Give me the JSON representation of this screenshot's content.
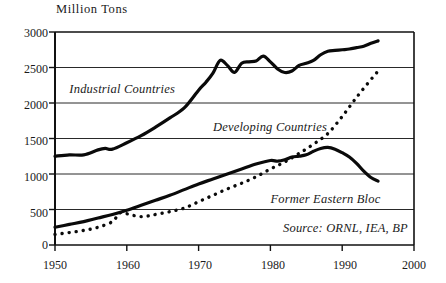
{
  "chart_data": {
    "type": "line",
    "title": "Million Tons",
    "xlabel": "",
    "ylabel": "Million Tons",
    "xlim": [
      1950,
      2000
    ],
    "ylim": [
      0,
      3000
    ],
    "grid": true,
    "legend_position": "inline-annotations",
    "y_ticks": [
      0,
      500,
      1000,
      1500,
      2000,
      2500,
      3000
    ],
    "x_ticks": [
      1950,
      1960,
      1970,
      1980,
      1990,
      2000
    ],
    "source": "Source: ORNL, IEA, BP",
    "series": [
      {
        "name": "Industrial Countries",
        "style": "solid",
        "label_x": 1952,
        "label_y": 2180,
        "x": [
          1950,
          1952,
          1954,
          1956,
          1957,
          1958,
          1960,
          1962,
          1964,
          1966,
          1968,
          1970,
          1971,
          1972,
          1973,
          1974,
          1975,
          1976,
          1977,
          1978,
          1979,
          1980,
          1981,
          1982,
          1983,
          1984,
          1985,
          1986,
          1987,
          1988,
          1989,
          1990,
          1991,
          1992,
          1993,
          1994,
          1995
        ],
        "y": [
          1250,
          1270,
          1270,
          1340,
          1360,
          1350,
          1440,
          1540,
          1660,
          1790,
          1930,
          2180,
          2290,
          2420,
          2600,
          2530,
          2430,
          2560,
          2580,
          2590,
          2660,
          2580,
          2480,
          2430,
          2450,
          2530,
          2560,
          2600,
          2680,
          2730,
          2740,
          2750,
          2760,
          2780,
          2800,
          2840,
          2875
        ]
      },
      {
        "name": "Developing Countries",
        "style": "dotted",
        "label_x": 1972,
        "label_y": 1650,
        "x": [
          1950,
          1952,
          1954,
          1956,
          1958,
          1959,
          1960,
          1961,
          1962,
          1963,
          1964,
          1966,
          1968,
          1970,
          1972,
          1974,
          1976,
          1978,
          1980,
          1982,
          1984,
          1986,
          1988,
          1990,
          1992,
          1994,
          1995
        ],
        "y": [
          150,
          175,
          205,
          250,
          330,
          450,
          440,
          415,
          400,
          410,
          430,
          470,
          520,
          610,
          700,
          790,
          870,
          960,
          1070,
          1170,
          1290,
          1420,
          1570,
          1810,
          2080,
          2330,
          2450
        ]
      },
      {
        "name": "Former Eastern Bloc",
        "style": "solid",
        "label_x": 1980,
        "label_y": 640,
        "x": [
          1950,
          1952,
          1954,
          1956,
          1958,
          1960,
          1962,
          1964,
          1966,
          1968,
          1970,
          1972,
          1974,
          1976,
          1978,
          1980,
          1981,
          1982,
          1983,
          1984,
          1985,
          1986,
          1987,
          1988,
          1989,
          1990,
          1991,
          1992,
          1993,
          1994,
          1995
        ],
        "y": [
          250,
          290,
          330,
          380,
          430,
          490,
          560,
          630,
          700,
          780,
          860,
          930,
          1000,
          1070,
          1140,
          1190,
          1180,
          1200,
          1240,
          1250,
          1270,
          1320,
          1360,
          1375,
          1350,
          1300,
          1240,
          1150,
          1040,
          950,
          900
        ]
      }
    ]
  },
  "axis_labels": {
    "y": [
      "3000",
      "2500",
      "2000",
      "1500",
      "1000",
      "500",
      "0"
    ],
    "x": [
      "1950",
      "1960",
      "1970",
      "1980",
      "1990",
      "2000"
    ]
  }
}
